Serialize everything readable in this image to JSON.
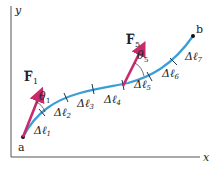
{
  "figure": {
    "axes": {
      "x_label": "x",
      "y_label": "y"
    },
    "points": {
      "start": "a",
      "end": "b"
    },
    "forces": [
      {
        "symbol": "F",
        "subscript": "1",
        "angle_symbol": "θ",
        "angle_subscript": "1"
      },
      {
        "symbol": "F",
        "subscript": "5",
        "angle_symbol": "θ",
        "angle_subscript": "5"
      }
    ],
    "segments": [
      {
        "symbol": "Δℓ",
        "subscript": "1"
      },
      {
        "symbol": "Δℓ",
        "subscript": "2"
      },
      {
        "symbol": "Δℓ",
        "subscript": "3"
      },
      {
        "symbol": "Δℓ",
        "subscript": "4"
      },
      {
        "symbol": "Δℓ",
        "subscript": "5"
      },
      {
        "symbol": "Δℓ",
        "subscript": "6"
      },
      {
        "symbol": "Δℓ",
        "subscript": "7"
      }
    ],
    "colors": {
      "path": "#3a9ed6",
      "force": "#c92a6b",
      "axis": "#555555",
      "text": "#222222"
    }
  }
}
